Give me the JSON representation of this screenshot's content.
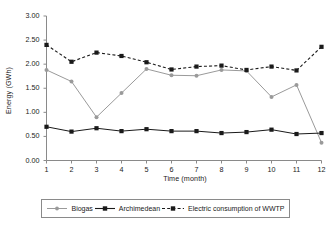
{
  "chart_data": {
    "type": "line",
    "title": "",
    "xlabel": "Time (month)",
    "ylabel": "Energy (GWh)",
    "x": [
      1,
      2,
      3,
      4,
      5,
      6,
      7,
      8,
      9,
      10,
      11,
      12
    ],
    "categories": [
      "1",
      "2",
      "3",
      "4",
      "5",
      "6",
      "7",
      "8",
      "9",
      "10",
      "11",
      "12"
    ],
    "xlim": [
      1,
      12
    ],
    "ylim": [
      0.0,
      3.0
    ],
    "yticks": [
      0.0,
      0.5,
      1.0,
      1.5,
      2.0,
      2.5,
      3.0
    ],
    "ytick_labels": [
      "0.00",
      "0.50",
      "1.00",
      "1.50",
      "2.00",
      "2.50",
      "3.00"
    ],
    "grid": false,
    "legend_position": "bottom",
    "series": [
      {
        "name": "Biogas",
        "values": [
          1.88,
          1.64,
          0.9,
          1.4,
          1.9,
          1.77,
          1.76,
          1.88,
          1.86,
          1.32,
          1.57,
          0.37
        ],
        "color": "#9a9a9a",
        "line_style": "solid",
        "marker": "circle"
      },
      {
        "name": "Archimedean",
        "values": [
          0.7,
          0.6,
          0.67,
          0.61,
          0.65,
          0.61,
          0.61,
          0.57,
          0.59,
          0.64,
          0.55,
          0.57
        ],
        "color": "#1a1a1a",
        "line_style": "solid",
        "marker": "square"
      },
      {
        "name": "Electric consumption of WWTP",
        "values": [
          2.4,
          2.05,
          2.24,
          2.17,
          2.04,
          1.89,
          1.95,
          1.97,
          1.88,
          1.95,
          1.87,
          2.36
        ],
        "color": "#1a1a1a",
        "line_style": "dashed",
        "marker": "square"
      }
    ]
  },
  "legend": {
    "items": [
      {
        "label": "Biogas"
      },
      {
        "label": "Archimedean"
      },
      {
        "label": "Electric consumption of WWTP"
      }
    ]
  },
  "axes": {
    "y_title": "Energy (GWh)",
    "x_title": "Time (month)"
  }
}
